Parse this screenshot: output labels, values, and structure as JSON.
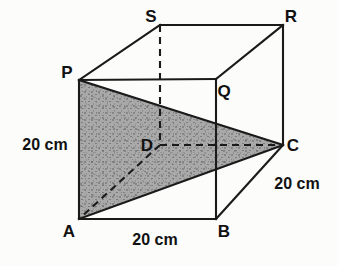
{
  "figure": {
    "kind": "geometry-diagram",
    "shape_name": "cube",
    "background_color": "#fcfcfb",
    "stroke_color": "#1a1a1a",
    "shaded_fill_color": "#a9a9a9",
    "shaded_speckle_color": "#6f6f6f",
    "shaded_region_vertices": "P-A-C",
    "vertices": [
      {
        "id": "P",
        "label": "P",
        "x": 79,
        "y": 80,
        "label_x": 67,
        "label_y": 72,
        "hidden": false
      },
      {
        "id": "Q",
        "label": "Q",
        "x": 216,
        "y": 79,
        "label_x": 224,
        "label_y": 91,
        "hidden": false
      },
      {
        "id": "R",
        "label": "R",
        "x": 283,
        "y": 25,
        "label_x": 291,
        "label_y": 16,
        "hidden": false
      },
      {
        "id": "S",
        "label": "S",
        "x": 160,
        "y": 25,
        "label_x": 151,
        "label_y": 16,
        "hidden": false
      },
      {
        "id": "A",
        "label": "A",
        "x": 79,
        "y": 219,
        "label_x": 69,
        "label_y": 231,
        "hidden": false
      },
      {
        "id": "B",
        "label": "B",
        "x": 216,
        "y": 219,
        "label_x": 224,
        "label_y": 231,
        "hidden": false
      },
      {
        "id": "C",
        "label": "C",
        "x": 283,
        "y": 145,
        "label_x": 293,
        "label_y": 145,
        "hidden": false
      },
      {
        "id": "D",
        "label": "D",
        "x": 160,
        "y": 145,
        "label_x": 147,
        "label_y": 145,
        "hidden": true
      }
    ],
    "solid_edges": [
      {
        "name": "edge-P-Q",
        "from": "P",
        "to": "Q"
      },
      {
        "name": "edge-Q-B",
        "from": "Q",
        "to": "B"
      },
      {
        "name": "edge-B-A",
        "from": "B",
        "to": "A"
      },
      {
        "name": "edge-A-P",
        "from": "A",
        "to": "P"
      },
      {
        "name": "edge-S-R",
        "from": "S",
        "to": "R"
      },
      {
        "name": "edge-R-C",
        "from": "R",
        "to": "C"
      },
      {
        "name": "edge-P-S",
        "from": "P",
        "to": "S"
      },
      {
        "name": "edge-Q-R",
        "from": "Q",
        "to": "R"
      },
      {
        "name": "edge-B-C",
        "from": "B",
        "to": "C"
      },
      {
        "name": "edge-P-C",
        "from": "P",
        "to": "C"
      },
      {
        "name": "edge-A-C",
        "from": "A",
        "to": "C"
      }
    ],
    "dashed_edges": [
      {
        "name": "hidden-edge-S-D",
        "from": "S",
        "to": "D"
      },
      {
        "name": "hidden-edge-D-C",
        "from": "D",
        "to": "C"
      },
      {
        "name": "hidden-edge-D-A",
        "from": "D",
        "to": "A"
      }
    ],
    "dimension_labels": [
      {
        "name": "dimension-left-height",
        "text": "20 cm",
        "x": 45,
        "y": 145
      },
      {
        "name": "dimension-bottom-width",
        "text": "20 cm",
        "x": 155,
        "y": 240
      },
      {
        "name": "dimension-right-depth",
        "text": "20 cm",
        "x": 297,
        "y": 184
      }
    ]
  }
}
